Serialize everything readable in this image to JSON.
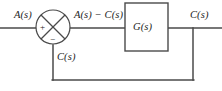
{
  "diagram": {
    "type": "control-system-block-diagram",
    "colors": {
      "stroke": "#4a4a4a",
      "text": "#1d1d1d",
      "background": "#ffffff"
    },
    "labels": {
      "input": "A(s)",
      "error": "A(s) − C(s)",
      "block": "G(s)",
      "output": "C(s)",
      "feedback": "C(s)"
    },
    "summing_junction": {
      "name": "summing-junction",
      "shape": "circle-with-diagonal-cross",
      "signs": {
        "plus": "+",
        "minus": "−"
      }
    },
    "block": {
      "name": "transfer-function-block",
      "label": "G(s)"
    },
    "wires": [
      {
        "name": "input-wire",
        "from": "left-edge",
        "to": "summing-junction"
      },
      {
        "name": "error-wire",
        "from": "summing-junction",
        "to": "transfer-function-block"
      },
      {
        "name": "output-wire",
        "from": "transfer-function-block",
        "to": "right-edge"
      },
      {
        "name": "feedback-down-wire",
        "from": "summing-junction",
        "to": "bottom-left-corner"
      },
      {
        "name": "feedback-bottom-wire",
        "from": "bottom-left-corner",
        "to": "bottom-right-corner"
      },
      {
        "name": "feedback-up-wire",
        "from": "bottom-right-corner",
        "to": "output-wire-tap"
      }
    ]
  }
}
